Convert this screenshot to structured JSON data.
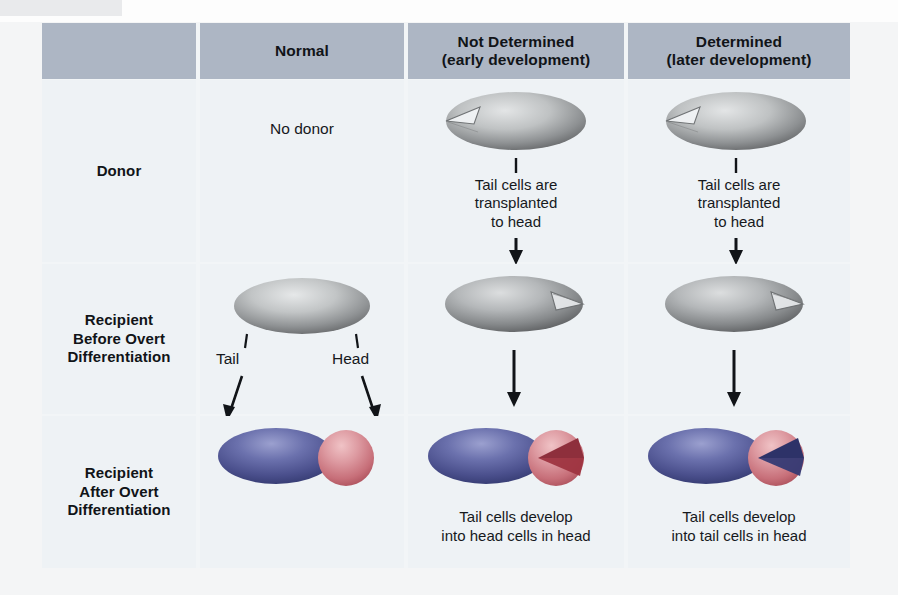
{
  "figure": {
    "header": {
      "corner_label": "",
      "columns": [
        {
          "line1": "Normal",
          "line2": ""
        },
        {
          "line1": "Not Determined",
          "line2": "(early development)"
        },
        {
          "line1": "Determined",
          "line2": "(later development)"
        }
      ]
    },
    "rows": [
      {
        "label_line1": "Donor",
        "label_line2": "",
        "label_line3": ""
      },
      {
        "label_line1": "Recipient",
        "label_line2": "Before Overt",
        "label_line3": "Differentiation"
      },
      {
        "label_line1": "Recipient",
        "label_line2": "After Overt",
        "label_line3": "Differentiation"
      }
    ],
    "cells": {
      "normal_donor_text": "No donor",
      "tail_label": "Tail",
      "head_label": "Head",
      "transplant_note_line1": "Tail cells are",
      "transplant_note_line2": "transplanted",
      "transplant_note_line3": "to head",
      "caption_not_determined_line1": "Tail cells develop",
      "caption_not_determined_line2": "into head cells in head",
      "caption_determined_line1": "Tail cells develop",
      "caption_determined_line2": "into tail cells in head"
    },
    "colors": {
      "header_band": "#adb6c4",
      "cell_background": "#eef2f5",
      "page_background": "#f4f5f6",
      "embryo_gray_light": "#d7d9da",
      "embryo_gray_dark": "#6e7173",
      "tail_blue": "#5a5f9e",
      "tail_blue_dark": "#2f3470",
      "head_pink": "#d98d95",
      "head_red_dark": "#9e3440",
      "text": "#16191d",
      "arrow": "#111418"
    },
    "icons": {
      "donor_embryo": "gray-embryo-notched-tail",
      "recipient_embryo": "gray-embryo-wedge-head",
      "normal_embryo": "gray-embryo-plain",
      "differentiated_normal": "blue-body-pink-head-embryo",
      "differentiated_not_determined": "blue-body-pink-head-dark-red-wedge-embryo",
      "differentiated_determined": "blue-body-pink-head-navy-wedge-embryo",
      "down_arrow": "arrow-down-icon",
      "leader_tick": "leader-line-icon"
    }
  }
}
